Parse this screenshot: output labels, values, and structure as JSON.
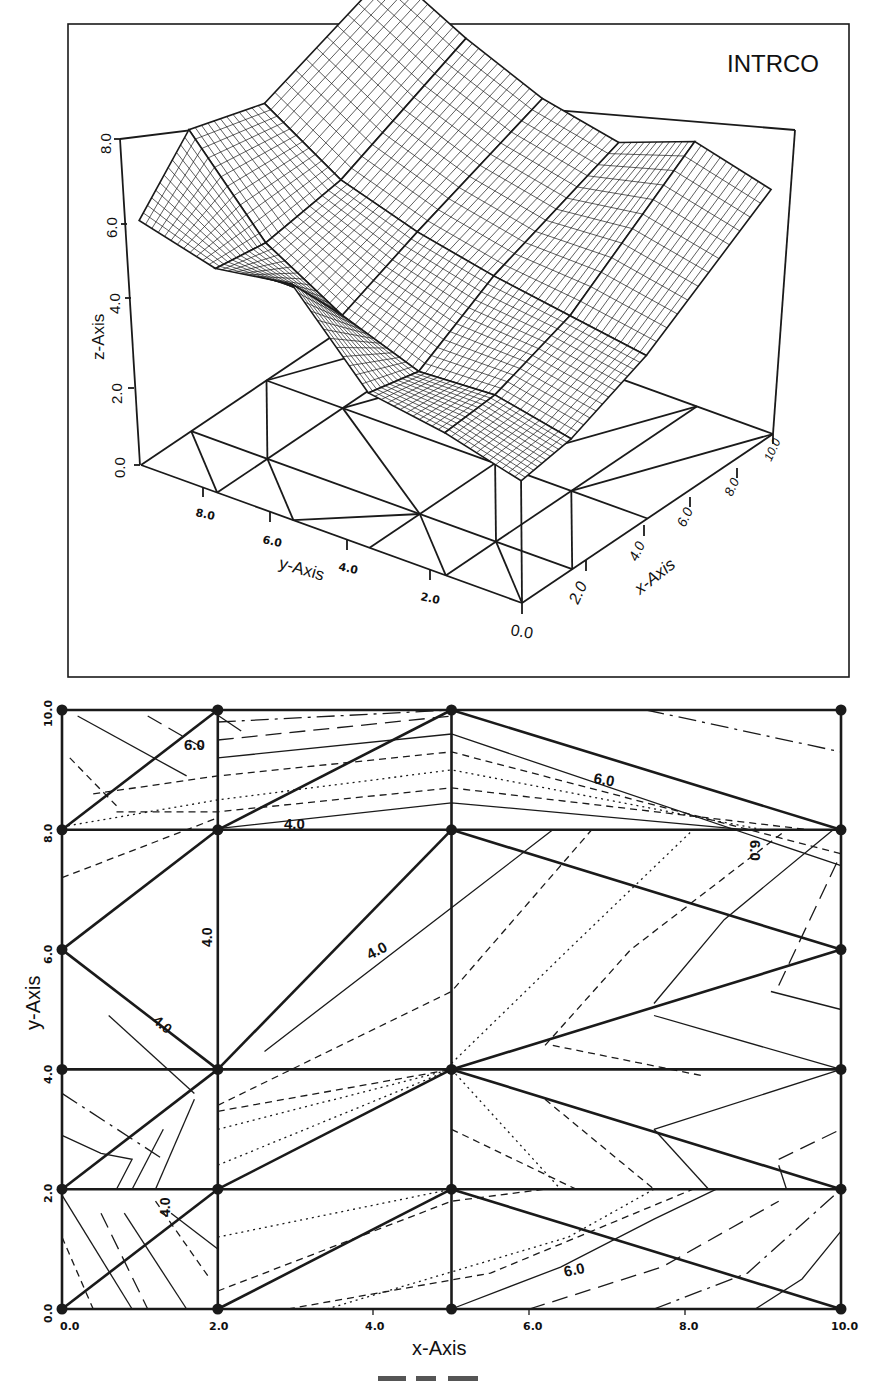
{
  "chart_data": [
    {
      "type": "surface3d",
      "title": "INTRCO",
      "xlabel": "x-Axis",
      "ylabel": "y-Axis",
      "zlabel": "z-Axis",
      "x_ticks": [
        "0.0",
        "2.0",
        "4.0",
        "6.0",
        "8.0",
        "10.0"
      ],
      "y_ticks": [
        "0.0",
        "2.0",
        "4.0",
        "6.0",
        "8.0"
      ],
      "z_ticks": [
        "0.0",
        "2.0",
        "4.0",
        "6.0",
        "8.0"
      ],
      "xlim": [
        0,
        10
      ],
      "ylim": [
        0,
        10
      ],
      "zlim": [
        0,
        8
      ],
      "grid": false,
      "nodes_x": [
        0,
        2,
        5,
        10
      ],
      "nodes_y": [
        0,
        2,
        4,
        6,
        8,
        10
      ],
      "z_values_estimated": [
        [
          3.0,
          3.2,
          4.0,
          6.0
        ],
        [
          3.5,
          3.6,
          4.3,
          6.5
        ],
        [
          3.8,
          3.5,
          4.6,
          5.8
        ],
        [
          5.8,
          4.2,
          5.0,
          6.2
        ],
        [
          5.5,
          5.3,
          5.6,
          7.0
        ],
        [
          6.0,
          7.4,
          6.8,
          8.0
        ]
      ]
    },
    {
      "type": "contour",
      "title": "",
      "xlabel": "x-Axis",
      "ylabel": "y-Axis",
      "x_ticks": [
        "0.0",
        "2.0",
        "4.0",
        "6.0",
        "8.0",
        "10.0"
      ],
      "y_ticks": [
        "0.0",
        "2.0",
        "4.0",
        "6.0",
        "8.0",
        "10.0"
      ],
      "xlim": [
        0,
        10
      ],
      "ylim": [
        0,
        10
      ],
      "grid": false,
      "contour_labels": [
        "6.0",
        "4.0",
        "6.0",
        "6.0",
        "4.0",
        "4.0",
        "4.0",
        "4.0",
        "6.0"
      ],
      "triangulation_nodes": [
        [
          0,
          0
        ],
        [
          2,
          0
        ],
        [
          5,
          0
        ],
        [
          10,
          0
        ],
        [
          0,
          2
        ],
        [
          2,
          2
        ],
        [
          5,
          2
        ],
        [
          10,
          2
        ],
        [
          0,
          4
        ],
        [
          2,
          4
        ],
        [
          5,
          4
        ],
        [
          10,
          4
        ],
        [
          0,
          6
        ],
        [
          10,
          6
        ],
        [
          0,
          8
        ],
        [
          2,
          8
        ],
        [
          5,
          8
        ],
        [
          10,
          8
        ],
        [
          0,
          10
        ],
        [
          2,
          10
        ],
        [
          5,
          10
        ],
        [
          10,
          10
        ]
      ]
    }
  ],
  "surface_panel": {
    "title": "INTRCO",
    "z_axis_label": "z-Axis",
    "y_axis_label": "y-Axis",
    "x_axis_label": "x-Axis",
    "z_ticks": [
      "0.0",
      "2.0",
      "4.0",
      "6.0",
      "8.0"
    ],
    "y_ticks": [
      "8.0",
      "6.0",
      "4.0",
      "2.0"
    ],
    "x_ticks": [
      "2.0",
      "4.0",
      "6.0",
      "8.0",
      "10.0"
    ],
    "origin_label": "0.0"
  },
  "contour_panel": {
    "x_axis_label": "x-Axis",
    "y_axis_label": "y-Axis",
    "x_ticks": [
      "0.0",
      "2.0",
      "4.0",
      "6.0",
      "8.0",
      "10.0"
    ],
    "y_ticks": [
      "0.0",
      "2.0",
      "4.0",
      "6.0",
      "8.0",
      "10.0"
    ],
    "labels": {
      "top_left_6": "6.0",
      "top_mid_4": "4.0",
      "top_right_6": "6.0",
      "right_vert_6": "6.0",
      "center_4": "4.0",
      "left_vert_4": "4.0",
      "left_diag_4": "4.0",
      "bottom_left_4": "4.0",
      "bottom_6": "6.0"
    }
  }
}
